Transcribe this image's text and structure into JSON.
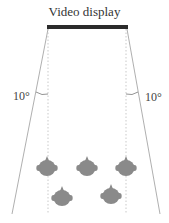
{
  "diagram": {
    "title": "Video display",
    "left_angle_label": "10°",
    "right_angle_label": "10°",
    "colors": {
      "display_bar": "#2b2b2b",
      "lines": "#9a9a9a",
      "dotted": "#bbbbbb",
      "heads": "#8a8a8a"
    },
    "viewers": {
      "front_row_count": 3,
      "back_row_count": 2
    }
  }
}
